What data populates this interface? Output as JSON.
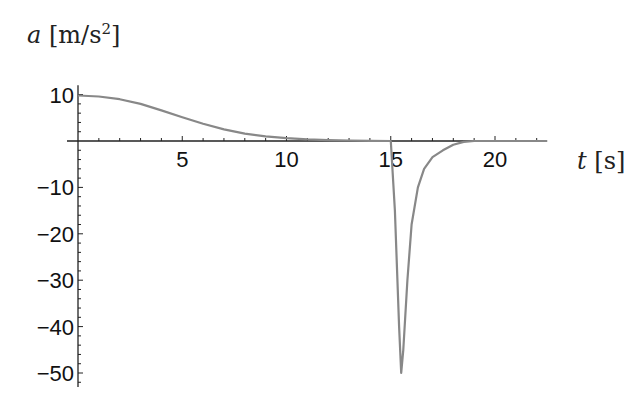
{
  "chart_data": {
    "type": "line",
    "title": "",
    "xlabel": "t [s]",
    "ylabel": "a [m/s²]",
    "xlim": [
      0,
      22.5
    ],
    "ylim": [
      -53,
      12
    ],
    "grid": false,
    "legend": null,
    "x_ticks": [
      5,
      10,
      15,
      20
    ],
    "y_ticks": [
      10,
      -10,
      -20,
      -30,
      -40,
      -50
    ],
    "series": [
      {
        "name": "acceleration",
        "color": "#888888",
        "x": [
          0,
          1,
          2,
          3,
          4,
          5,
          6,
          7,
          8,
          9,
          10,
          11,
          12,
          13,
          14,
          15,
          15.2,
          15.4,
          15.5,
          15.6,
          15.8,
          16.0,
          16.3,
          16.6,
          17.0,
          17.5,
          18.0,
          18.5,
          19,
          20,
          21,
          22.5
        ],
        "values": [
          9.8,
          9.6,
          9.0,
          8.0,
          6.6,
          5.1,
          3.7,
          2.5,
          1.6,
          1.0,
          0.6,
          0.35,
          0.2,
          0.1,
          0.05,
          0.0,
          -15,
          -40,
          -50,
          -45,
          -30,
          -18,
          -10,
          -6,
          -3.5,
          -2,
          -0.8,
          -0.2,
          0,
          0,
          0,
          0
        ]
      }
    ]
  },
  "labels": {
    "y_var": "a",
    "y_unit": "[m/s",
    "y_exp": "2",
    "y_close": "]",
    "x_var": "t",
    "x_unit": "[s]"
  }
}
